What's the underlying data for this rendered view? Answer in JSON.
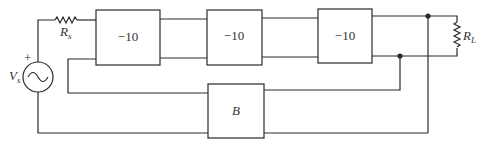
{
  "diagram": {
    "type": "circuit-block-diagram",
    "source": {
      "label": "V",
      "subscript": "s",
      "polarity": "+"
    },
    "source_resistor": {
      "label": "R",
      "subscript": "s"
    },
    "amplifier_stages": [
      {
        "gain": "−10"
      },
      {
        "gain": "−10"
      },
      {
        "gain": "−10"
      }
    ],
    "feedback_block": {
      "label": "B"
    },
    "load_resistor": {
      "label": "R",
      "subscript": "L"
    }
  }
}
